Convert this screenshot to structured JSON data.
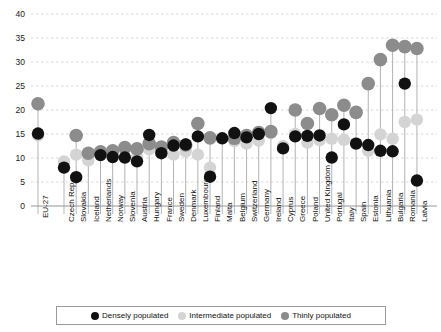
{
  "chart_data": {
    "type": "scatter",
    "title": "",
    "xlabel": "",
    "ylabel": "",
    "ylim": [
      0,
      40
    ],
    "ytick_step": 5,
    "yticks": [
      0,
      5,
      10,
      15,
      20,
      25,
      30,
      35,
      40
    ],
    "grid": true,
    "legend_position": "bottom",
    "colors": {
      "densely": "#111111",
      "intermediate": "#d4d4d4",
      "thinly": "#8c8c8c",
      "stem": "#b3b3b3",
      "grid": "#c9c9d6",
      "axis": "#9a9a9a"
    },
    "categories": [
      "EU-27",
      "Czech Rep.",
      "Slovakia",
      "Iceland",
      "Netherlands",
      "Norway",
      "Slovenia",
      "Austria",
      "Hungary",
      "France",
      "Sweden",
      "Denmark",
      "Luxembourg",
      "Finland",
      "Malta",
      "Belgium",
      "Switzerland",
      "Germany",
      "Ireland",
      "Cyprus",
      "Greece",
      "Poland",
      "United Kingdom",
      "Portugal",
      "Italy",
      "Spain",
      "Estonia",
      "Lithuania",
      "Bulgaria",
      "Romania",
      "Latvia"
    ],
    "series": [
      {
        "name": "Densely populated",
        "key": "densely",
        "values": [
          15.1,
          8.0,
          6.0,
          null,
          10.6,
          10.2,
          10.1,
          9.3,
          14.8,
          11.0,
          12.6,
          12.8,
          14.5,
          6.1,
          14.1,
          15.2,
          14.3,
          15.0,
          20.4,
          12.0,
          14.5,
          14.6,
          14.7,
          10.1,
          17.0,
          13.0,
          12.7,
          11.5,
          11.4,
          25.5,
          5.3
        ]
      },
      {
        "name": "Intermediate populated",
        "key": "intermediate",
        "values": [
          14.7,
          9.3,
          10.7,
          9.5,
          11.0,
          10.3,
          11.8,
          10.3,
          11.8,
          11.2,
          10.7,
          11.4,
          10.7,
          8.0,
          null,
          13.5,
          13.0,
          13.6,
          15.2,
          12.5,
          15.0,
          13.2,
          13.7,
          14.0,
          13.8,
          13.1,
          11.5,
          14.9,
          14.0,
          17.5,
          18.0
        ]
      },
      {
        "name": "Thinly populated",
        "key": "thinly",
        "values": [
          21.3,
          null,
          14.7,
          11.0,
          11.3,
          11.5,
          12.2,
          11.9,
          13.0,
          12.3,
          13.2,
          12.7,
          17.2,
          14.2,
          null,
          14.1,
          14.7,
          15.3,
          15.5,
          null,
          20.0,
          17.2,
          20.3,
          19.0,
          21.0,
          19.5,
          25.5,
          30.5,
          33.5,
          33.2,
          32.8
        ]
      }
    ]
  },
  "legend": {
    "items": [
      {
        "label": "Densely populated",
        "color": "#111111"
      },
      {
        "label": "Intermediate populated",
        "color": "#d4d4d4"
      },
      {
        "label": "Thinly populated",
        "color": "#8c8c8c"
      }
    ]
  }
}
